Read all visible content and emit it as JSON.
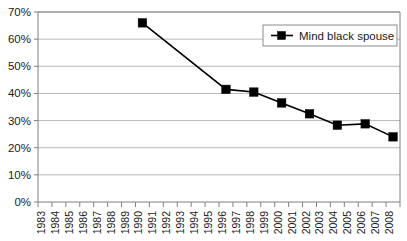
{
  "chart_data": {
    "type": "line",
    "title": "",
    "subtitle": "",
    "xlabel": "",
    "ylabel": "",
    "grid": true,
    "legend_position": "top-right",
    "categories": [
      "1983",
      "1984",
      "1985",
      "1986",
      "1987",
      "1988",
      "1989",
      "1990",
      "1991",
      "1992",
      "1993",
      "1994",
      "1995",
      "1996",
      "1997",
      "1998",
      "1999",
      "2000",
      "2001",
      "2002",
      "2003",
      "2004",
      "2005",
      "2006",
      "2007",
      "2008"
    ],
    "ylim": [
      0,
      70
    ],
    "ytick_labels": [
      "0%",
      "10%",
      "20%",
      "30%",
      "40%",
      "50%",
      "60%",
      "70%"
    ],
    "ytick_values": [
      0,
      10,
      20,
      30,
      40,
      50,
      60,
      70
    ],
    "series": [
      {
        "name": "Mind black spouse",
        "color": "#000000",
        "marker": "square",
        "x": [
          "1990",
          "1996",
          "1998",
          "2000",
          "2002",
          "2004",
          "2006",
          "2008"
        ],
        "values": [
          66,
          41.5,
          40.5,
          36.5,
          32.5,
          28.3,
          28.8,
          24
        ]
      }
    ]
  },
  "legend": {
    "entries": [
      {
        "label": "Mind black spouse",
        "marker_name": "legend-marker-square"
      }
    ]
  },
  "axes": {
    "y_axis_name": "percentage-axis",
    "x_axis_name": "year-axis"
  }
}
